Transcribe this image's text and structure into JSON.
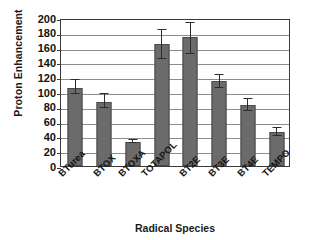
{
  "chart_data": {
    "type": "bar",
    "title": "",
    "xlabel": "Radical Species",
    "ylabel": "Proton Enhancement",
    "categories": [
      "BTurea",
      "BTOX",
      "BTOXA",
      "TOTAPOL",
      "BT2E",
      "BT3E",
      "BT4E",
      "TEMPO"
    ],
    "values": [
      105,
      87,
      33,
      165,
      175,
      115,
      82,
      46
    ],
    "errors_low": [
      97,
      78,
      31,
      145,
      152,
      105,
      75,
      41
    ],
    "errors_high": [
      118,
      98,
      36,
      185,
      195,
      125,
      92,
      53
    ],
    "ylim": [
      0,
      200
    ],
    "yticks": [
      0,
      20,
      40,
      60,
      80,
      100,
      120,
      140,
      160,
      180,
      200
    ],
    "ytick_labels": [
      "0",
      "20",
      "40",
      "60",
      "80",
      "100",
      "120",
      "140",
      "160",
      "180",
      "200"
    ],
    "grid": true,
    "legend": false,
    "bar_color": "#6b6b6b",
    "bar_edge_color": "#4a4a4a",
    "error_color": "#2b2b2b",
    "grid_color": "#8d8d8d",
    "axis_color": "#3a3a3a",
    "background": "#ffffff"
  }
}
